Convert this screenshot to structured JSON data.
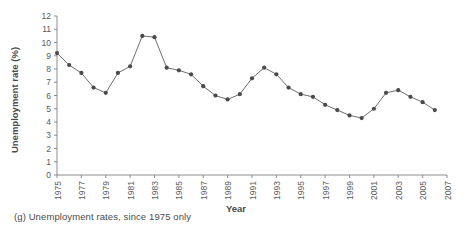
{
  "figure": {
    "caption": "(g) Unemployment rates, since 1975 only",
    "label": "(g)"
  },
  "chart_data": {
    "type": "line",
    "title": "",
    "xlabel": "Year",
    "ylabel": "Unemployment rate (%)",
    "xlim": [
      1975,
      2007
    ],
    "ylim": [
      0,
      12
    ],
    "grid": false,
    "legend": null,
    "marker": "filled-circle",
    "y_ticks": [
      0,
      1,
      2,
      3,
      4,
      5,
      6,
      7,
      8,
      9,
      10,
      11,
      12
    ],
    "y_tick_labels": [
      "0",
      "1",
      "2",
      "3",
      "4",
      "5",
      "6",
      "7",
      "8",
      "9",
      "10",
      "11",
      "12"
    ],
    "x_ticks": [
      1975,
      1977,
      1979,
      1981,
      1983,
      1985,
      1987,
      1989,
      1991,
      1993,
      1995,
      1997,
      1999,
      2001,
      2003,
      2005,
      2007
    ],
    "x_tick_labels": [
      "1975",
      "1977",
      "1979",
      "1981",
      "1983",
      "1985",
      "1987",
      "1989",
      "1991",
      "1993",
      "1995",
      "1997",
      "1999",
      "2001",
      "2003",
      "2005",
      "2007"
    ],
    "x": [
      1975,
      1976,
      1977,
      1978,
      1979,
      1980,
      1981,
      1982,
      1983,
      1984,
      1985,
      1986,
      1987,
      1988,
      1989,
      1990,
      1991,
      1992,
      1993,
      1994,
      1995,
      1996,
      1997,
      1998,
      1999,
      2000,
      2001,
      2002,
      2003,
      2004,
      2005,
      2006
    ],
    "values": [
      9.2,
      8.3,
      7.7,
      6.6,
      6.2,
      7.7,
      8.2,
      10.5,
      10.4,
      8.1,
      7.9,
      7.6,
      6.7,
      6.0,
      5.7,
      6.1,
      7.3,
      8.1,
      7.6,
      6.6,
      6.1,
      5.9,
      5.3,
      4.9,
      4.5,
      4.3,
      5.0,
      6.2,
      6.4,
      5.9,
      5.5,
      4.9
    ]
  }
}
